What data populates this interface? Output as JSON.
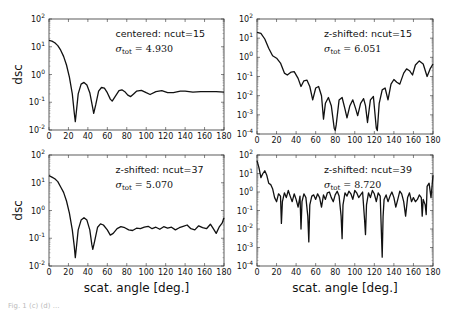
{
  "figure": {
    "caption_partial": "Fig. 1 (c) (d) ..."
  },
  "chart_data": [
    {
      "type": "line",
      "panel": "top-left",
      "annotation": "centered: ncut=15",
      "sigma_label": "σ_tot = 4.930",
      "sigma_sub": "tot",
      "sigma_value": "4.930",
      "xlabel": "",
      "ylabel": "dsc",
      "xlim": [
        0,
        180
      ],
      "ylim": [
        0.01,
        100
      ],
      "yscale": "log",
      "xticks": [
        "0",
        "20",
        "40",
        "60",
        "80",
        "100",
        "120",
        "140",
        "160",
        "180"
      ],
      "yticks": [
        "10^-2",
        "10^-1",
        "10^0",
        "10^1",
        "10^2"
      ],
      "x": [
        0,
        3,
        6,
        9,
        12,
        15,
        18,
        21,
        24,
        26,
        27,
        28,
        30,
        33,
        36,
        39,
        42,
        45,
        46,
        48,
        51,
        54,
        57,
        60,
        63,
        65,
        68,
        72,
        75,
        78,
        81,
        84,
        87,
        90,
        95,
        100,
        104,
        110,
        116,
        122,
        128,
        135,
        140,
        148,
        156,
        165,
        172,
        180
      ],
      "y": [
        17,
        16,
        14,
        11,
        7.5,
        4.5,
        2.2,
        0.8,
        0.2,
        0.04,
        0.02,
        0.04,
        0.2,
        0.45,
        0.52,
        0.42,
        0.22,
        0.06,
        0.04,
        0.08,
        0.25,
        0.34,
        0.32,
        0.22,
        0.13,
        0.11,
        0.16,
        0.26,
        0.28,
        0.24,
        0.18,
        0.16,
        0.2,
        0.25,
        0.27,
        0.22,
        0.19,
        0.24,
        0.26,
        0.22,
        0.22,
        0.25,
        0.25,
        0.23,
        0.24,
        0.24,
        0.24,
        0.23
      ]
    },
    {
      "type": "line",
      "panel": "top-right",
      "annotation": "z-shifted: ncut=15",
      "sigma_label": "σ_tot = 6.051",
      "sigma_sub": "tot",
      "sigma_value": "6.051",
      "xlabel": "",
      "ylabel": "",
      "xlim": [
        0,
        180
      ],
      "ylim": [
        0.0001,
        100
      ],
      "yscale": "log",
      "xticks": [
        "0",
        "20",
        "40",
        "60",
        "80",
        "100",
        "120",
        "140",
        "160",
        "180"
      ],
      "yticks": [
        "10^-4",
        "10^-3",
        "10^-2",
        "10^-1",
        "10^0",
        "10^1",
        "10^2"
      ],
      "x": [
        0,
        4,
        8,
        12,
        16,
        20,
        24,
        28,
        31,
        35,
        38,
        42,
        45,
        48,
        51,
        54,
        57,
        60,
        63,
        66,
        68,
        70,
        73,
        76,
        79,
        80,
        81,
        84,
        87,
        90,
        92,
        95,
        98,
        101,
        103,
        106,
        109,
        111,
        113,
        116,
        119,
        122,
        123,
        125,
        128,
        131,
        134,
        137,
        140,
        143,
        146,
        150,
        153,
        156,
        159,
        162,
        166,
        170,
        174,
        177,
        180
      ],
      "y": [
        20,
        18,
        9,
        3,
        1.2,
        0.9,
        0.5,
        0.15,
        0.12,
        0.17,
        0.18,
        0.08,
        0.03,
        0.06,
        0.065,
        0.03,
        0.006,
        0.025,
        0.03,
        0.01,
        0.0006,
        0.004,
        0.008,
        0.003,
        0.0002,
        0.00015,
        0.0003,
        0.006,
        0.008,
        0.002,
        0.0007,
        0.003,
        0.006,
        0.002,
        0.0009,
        0.004,
        0.007,
        0.003,
        0.0004,
        0.006,
        0.009,
        0.0002,
        0.00015,
        0.004,
        0.02,
        0.025,
        0.006,
        0.04,
        0.07,
        0.05,
        0.04,
        0.15,
        0.25,
        0.2,
        0.12,
        0.4,
        0.65,
        0.45,
        0.1,
        0.25,
        0.45
      ]
    },
    {
      "type": "line",
      "panel": "bottom-left",
      "annotation": "z-shifted: ncut=37",
      "sigma_label": "σ_tot = 5.070",
      "sigma_sub": "tot",
      "sigma_value": "5.070",
      "xlabel": "scat. angle [deg.]",
      "ylabel": "dsc",
      "xlim": [
        0,
        180
      ],
      "ylim": [
        0.01,
        100
      ],
      "yscale": "log",
      "xticks": [
        "0",
        "20",
        "40",
        "60",
        "80",
        "100",
        "120",
        "140",
        "160",
        "180"
      ],
      "yticks": [
        "10^-2",
        "10^-1",
        "10^0",
        "10^1",
        "10^2"
      ],
      "x": [
        0,
        3,
        6,
        9,
        12,
        15,
        18,
        21,
        24,
        26,
        27,
        28,
        30,
        33,
        36,
        39,
        42,
        44,
        45,
        47,
        50,
        53,
        56,
        60,
        63,
        66,
        70,
        74,
        78,
        82,
        86,
        90,
        94,
        98,
        102,
        106,
        110,
        114,
        118,
        122,
        126,
        130,
        134,
        138,
        142,
        146,
        150,
        154,
        158,
        162,
        166,
        169,
        172,
        175,
        178,
        180
      ],
      "y": [
        18,
        16,
        14,
        11,
        7,
        4.5,
        2.2,
        0.8,
        0.2,
        0.05,
        0.02,
        0.04,
        0.2,
        0.45,
        0.55,
        0.45,
        0.2,
        0.06,
        0.04,
        0.08,
        0.25,
        0.33,
        0.3,
        0.2,
        0.13,
        0.15,
        0.22,
        0.26,
        0.24,
        0.2,
        0.19,
        0.23,
        0.22,
        0.25,
        0.27,
        0.22,
        0.25,
        0.21,
        0.26,
        0.23,
        0.25,
        0.2,
        0.24,
        0.27,
        0.3,
        0.22,
        0.2,
        0.28,
        0.24,
        0.22,
        0.32,
        0.22,
        0.15,
        0.25,
        0.35,
        0.55
      ]
    },
    {
      "type": "line",
      "panel": "bottom-right",
      "annotation": "z-shifted: ncut=39",
      "sigma_label": "σ_tot = 8.720",
      "sigma_sub": "tot",
      "sigma_value": "8.720",
      "xlabel": "scat. angle [deg.]",
      "ylabel": "",
      "xlim": [
        0,
        180
      ],
      "ylim": [
        0.0001,
        100
      ],
      "yscale": "log",
      "xticks": [
        "0",
        "20",
        "40",
        "60",
        "80",
        "100",
        "120",
        "140",
        "160",
        "180"
      ],
      "yticks": [
        "10^-4",
        "10^-3",
        "10^-2",
        "10^-1",
        "10^0",
        "10^1",
        "10^2"
      ],
      "x": [
        0,
        2,
        4,
        6,
        8,
        10,
        12,
        14,
        16,
        18,
        20,
        22,
        24,
        25,
        26,
        28,
        30,
        32,
        34,
        36,
        38,
        40,
        42,
        44,
        45,
        46,
        48,
        50,
        52,
        53,
        54,
        56,
        58,
        60,
        62,
        64,
        66,
        68,
        70,
        72,
        74,
        76,
        78,
        80,
        82,
        84,
        86,
        87,
        88,
        90,
        92,
        94,
        96,
        98,
        100,
        102,
        104,
        106,
        108,
        110,
        111,
        112,
        114,
        116,
        118,
        120,
        122,
        124,
        126,
        128,
        129,
        130,
        132,
        134,
        136,
        138,
        140,
        142,
        144,
        146,
        148,
        150,
        152,
        154,
        156,
        158,
        160,
        162,
        164,
        166,
        168,
        169,
        170,
        172,
        173,
        174,
        176,
        178,
        180
      ],
      "y": [
        50,
        20,
        6,
        10,
        14,
        8,
        3,
        2.5,
        1.5,
        0.5,
        0.3,
        0.8,
        0.6,
        0.02,
        0.3,
        0.9,
        0.5,
        1.2,
        0.6,
        0.3,
        0.8,
        0.4,
        0.15,
        0.6,
        0.01,
        0.3,
        0.8,
        0.5,
        0.05,
        0.002,
        0.2,
        0.6,
        0.7,
        0.4,
        0.8,
        0.5,
        0.15,
        0.7,
        0.4,
        0.9,
        1.0,
        0.5,
        0.3,
        0.7,
        1.1,
        0.6,
        0.05,
        0.003,
        0.2,
        0.9,
        0.6,
        1.1,
        0.8,
        0.4,
        1.2,
        0.9,
        0.5,
        0.7,
        1.0,
        0.03,
        0.005,
        0.2,
        0.9,
        0.5,
        1.2,
        0.8,
        0.3,
        0.9,
        0.6,
        0.0003,
        0.05,
        0.4,
        0.7,
        0.3,
        0.6,
        1.0,
        0.5,
        0.15,
        0.4,
        1.1,
        0.8,
        0.3,
        0.05,
        0.5,
        0.9,
        0.3,
        0.5,
        0.3,
        0.4,
        0.7,
        0.5,
        0.05,
        0.4,
        0.2,
        0.06,
        2,
        3,
        0.5,
        8
      ]
    }
  ]
}
